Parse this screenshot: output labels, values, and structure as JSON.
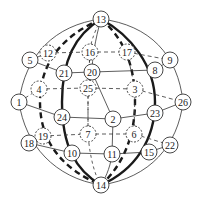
{
  "diagram": {
    "type": "sphere-node-graph",
    "colors": {
      "background": "#ffffff",
      "stroke": "#333333",
      "thick_stroke": "#1a1a1a",
      "node_fill": "#ffffff",
      "text": "#222222"
    },
    "sphere": {
      "cx": 101,
      "cy": 102,
      "rx": 84,
      "ry": 83
    },
    "nodes": [
      {
        "id": "13",
        "label": "13",
        "x": 101,
        "y": 19,
        "style": "solid"
      },
      {
        "id": "14",
        "label": "14",
        "x": 101,
        "y": 185,
        "style": "solid"
      },
      {
        "id": "5",
        "label": "5",
        "x": 30,
        "y": 60,
        "style": "solid"
      },
      {
        "id": "12",
        "label": "12",
        "x": 48,
        "y": 53,
        "style": "dashed"
      },
      {
        "id": "16",
        "label": "16",
        "x": 90,
        "y": 52,
        "style": "dashed"
      },
      {
        "id": "17",
        "label": "17",
        "x": 127,
        "y": 52,
        "style": "dashed"
      },
      {
        "id": "9",
        "label": "9",
        "x": 170,
        "y": 60,
        "style": "solid"
      },
      {
        "id": "8",
        "label": "8",
        "x": 155,
        "y": 70,
        "style": "solid"
      },
      {
        "id": "21",
        "label": "21",
        "x": 64,
        "y": 73,
        "style": "solid"
      },
      {
        "id": "20",
        "label": "20",
        "x": 92,
        "y": 72,
        "style": "solid"
      },
      {
        "id": "4",
        "label": "4",
        "x": 39,
        "y": 89,
        "style": "dashed"
      },
      {
        "id": "25",
        "label": "25",
        "x": 88,
        "y": 88,
        "style": "dashed"
      },
      {
        "id": "3",
        "label": "3",
        "x": 135,
        "y": 89,
        "style": "dashed"
      },
      {
        "id": "1",
        "label": "1",
        "x": 19,
        "y": 102,
        "style": "solid"
      },
      {
        "id": "26",
        "label": "26",
        "x": 183,
        "y": 102,
        "style": "solid"
      },
      {
        "id": "24",
        "label": "24",
        "x": 62,
        "y": 117,
        "style": "solid"
      },
      {
        "id": "2",
        "label": "2",
        "x": 113,
        "y": 119,
        "style": "solid"
      },
      {
        "id": "23",
        "label": "23",
        "x": 155,
        "y": 113,
        "style": "solid"
      },
      {
        "id": "19",
        "label": "19",
        "x": 43,
        "y": 136,
        "style": "dashed"
      },
      {
        "id": "7",
        "label": "7",
        "x": 88,
        "y": 134,
        "style": "dashed"
      },
      {
        "id": "6",
        "label": "6",
        "x": 134,
        "y": 134,
        "style": "dashed"
      },
      {
        "id": "18",
        "label": "18",
        "x": 29,
        "y": 143,
        "style": "solid"
      },
      {
        "id": "10",
        "label": "10",
        "x": 72,
        "y": 153,
        "style": "solid"
      },
      {
        "id": "11",
        "label": "11",
        "x": 112,
        "y": 154,
        "style": "solid"
      },
      {
        "id": "15",
        "label": "15",
        "x": 149,
        "y": 152,
        "style": "solid"
      },
      {
        "id": "22",
        "label": "22",
        "x": 170,
        "y": 145,
        "style": "solid"
      }
    ],
    "edges": [
      {
        "from": "5",
        "to": "21",
        "style": "thin"
      },
      {
        "from": "21",
        "to": "20",
        "style": "thin"
      },
      {
        "from": "20",
        "to": "8",
        "style": "thin"
      },
      {
        "from": "8",
        "to": "9",
        "style": "thin"
      },
      {
        "from": "1",
        "to": "24",
        "style": "thin"
      },
      {
        "from": "24",
        "to": "2",
        "style": "thin"
      },
      {
        "from": "2",
        "to": "23",
        "style": "thin"
      },
      {
        "from": "23",
        "to": "26",
        "style": "thin"
      },
      {
        "from": "18",
        "to": "10",
        "style": "thin"
      },
      {
        "from": "10",
        "to": "11",
        "style": "thin"
      },
      {
        "from": "11",
        "to": "15",
        "style": "thin"
      },
      {
        "from": "15",
        "to": "22",
        "style": "thin"
      },
      {
        "from": "20",
        "to": "2",
        "style": "thin"
      },
      {
        "from": "2",
        "to": "11",
        "style": "thin"
      },
      {
        "from": "12",
        "to": "16",
        "style": "dashed"
      },
      {
        "from": "16",
        "to": "17",
        "style": "dashed"
      },
      {
        "from": "5",
        "to": "12",
        "style": "dashed"
      },
      {
        "from": "17",
        "to": "9",
        "style": "dashed"
      },
      {
        "from": "4",
        "to": "25",
        "style": "dashed"
      },
      {
        "from": "25",
        "to": "3",
        "style": "dashed"
      },
      {
        "from": "1",
        "to": "4",
        "style": "dashed"
      },
      {
        "from": "3",
        "to": "26",
        "style": "dashed"
      },
      {
        "from": "19",
        "to": "7",
        "style": "dashed"
      },
      {
        "from": "7",
        "to": "6",
        "style": "dashed"
      },
      {
        "from": "18",
        "to": "19",
        "style": "dashed"
      },
      {
        "from": "6",
        "to": "22",
        "style": "dashed"
      },
      {
        "from": "16",
        "to": "25",
        "style": "dashed"
      },
      {
        "from": "25",
        "to": "7",
        "style": "dashed"
      },
      {
        "from": "17",
        "to": "3",
        "style": "dashed"
      },
      {
        "from": "3",
        "to": "6",
        "style": "dashed"
      }
    ],
    "meridians": [
      {
        "name": "left-outer",
        "style": "thin",
        "path": "M101,19 C55,25 25,55 19,102 C25,145 55,178 101,185"
      },
      {
        "name": "right-outer",
        "style": "thin",
        "path": "M101,19 C150,25 178,55 183,102 C178,145 150,178 101,185"
      },
      {
        "name": "left-thick",
        "style": "thick",
        "path": "M101,19 C75,35 62,60 62,102 C62,145 75,170 101,185"
      },
      {
        "name": "right-thick",
        "style": "thick",
        "path": "M101,19 C130,35 155,65 155,102 C155,140 135,170 101,185"
      },
      {
        "name": "left-heavy-dash",
        "style": "heavy-dash",
        "path": "M101,19 C65,35 40,60 40,102 C40,140 60,168 101,185"
      },
      {
        "name": "right-heavy-dash",
        "style": "heavy-dash",
        "path": "M101,19 C120,35 135,60 135,102 C135,140 120,168 101,185"
      },
      {
        "name": "center-left-thin",
        "style": "thin",
        "path": "M101,19 C95,40 92,60 92,72"
      },
      {
        "name": "center-right-thin-bottom",
        "style": "thin",
        "path": "M112,154 C110,170 104,180 101,185"
      },
      {
        "name": "center-dashed",
        "style": "dashed",
        "path": "M101,19 C93,35 90,45 90,52 L88,88 L88,134 C90,160 96,178 101,185"
      }
    ]
  }
}
